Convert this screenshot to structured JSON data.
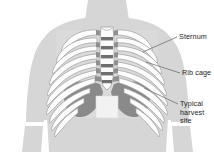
{
  "figure": {
    "type": "anatomical-illustration",
    "view": "anterior",
    "background_color": "#ffffff"
  },
  "labels": {
    "sternum": "Sternum",
    "rib_cage": "Rib cage",
    "harvest_line1": "Typical",
    "harvest_line2": "harvest",
    "harvest_line3": "site"
  },
  "edge_fragments": {
    "left_clipped": "e"
  },
  "colors": {
    "body_silhouette": "#d6d6d6",
    "body_outline": "#c2c2c2",
    "rib_fill": "#fdfdfd",
    "rib_outline": "#9b9b9b",
    "cartilage": "#8f8f8f",
    "sternum_fill": "#fbfbfb",
    "sternum_segment": "#6f6f6f",
    "harvest_shade": "#8a8a8a",
    "leader_line": "#6b6b6b",
    "label_text": "#1b1b1b"
  },
  "anatomy": {
    "structures": [
      "neck",
      "left-shoulder",
      "right-shoulder",
      "left-arm",
      "right-arm",
      "torso",
      "sternum",
      "rib-cage",
      "costal-cartilage",
      "harvest-site"
    ],
    "rib_pairs_visible": 10,
    "sternum_segments": 6
  },
  "leader_lines": [
    {
      "name": "sternum-leader",
      "x1": 177,
      "y1": 37,
      "x2": 143,
      "y2": 52
    },
    {
      "name": "ribcage-leader",
      "x1": 180,
      "y1": 73,
      "x2": 146,
      "y2": 62
    },
    {
      "name": "harvest-leader",
      "x1": 178,
      "y1": 104,
      "x2": 144,
      "y2": 88
    }
  ]
}
